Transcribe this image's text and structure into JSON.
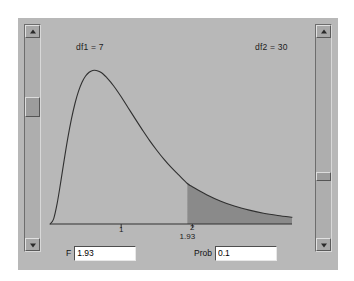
{
  "app": {
    "title": "F Distribution Calculator",
    "panel_bg": "#b8b8b8",
    "curve_color": "#303030",
    "shade_color": "#8a8a8a"
  },
  "plot": {
    "df1_label": "df1 = 7",
    "df2_label": "df2 = 30",
    "tick_labels": [
      "1",
      "2"
    ],
    "critical_annotation": "1.93"
  },
  "scrollbars": {
    "df1": {
      "name": "df1-scrollbar",
      "up_arrow": "triangle-up-icon",
      "down_arrow": "triangle-down-icon",
      "thumb_position_percent": 33
    },
    "df2": {
      "name": "df2-scrollbar",
      "up_arrow": "triangle-up-icon",
      "down_arrow": "triangle-down-icon",
      "thumb_position_percent": 70
    }
  },
  "controls": {
    "f_label": "F",
    "f_value": "1.93",
    "prob_label": "Prob",
    "prob_value": "0.1"
  },
  "chart_data": {
    "type": "line",
    "title": "",
    "xlabel": "",
    "ylabel": "",
    "xlim": [
      0,
      3.4
    ],
    "ylim": [
      0,
      0.85
    ],
    "grid": false,
    "legend": "none",
    "distribution": "F",
    "df1": 7,
    "df2": 30,
    "critical_value": 1.93,
    "tail_probability": 0.1,
    "shaded_region": {
      "from": 1.93,
      "to": 3.4,
      "side": "right-tail"
    },
    "xticks": [
      1,
      2
    ],
    "xticklabels": [
      "1",
      "2"
    ],
    "annotations": [
      {
        "text": "df1 = 7",
        "x": 0.45,
        "y": 0.72
      },
      {
        "text": "df2 = 30",
        "x": 2.55,
        "y": 0.72
      },
      {
        "text": "1.93",
        "x": 1.93,
        "y": -0.08
      }
    ],
    "x": [
      0.0,
      0.05,
      0.1,
      0.15,
      0.2,
      0.25,
      0.3,
      0.35,
      0.4,
      0.45,
      0.5,
      0.55,
      0.6,
      0.65,
      0.7,
      0.75,
      0.8,
      0.85,
      0.9,
      0.95,
      1.0,
      1.1,
      1.2,
      1.3,
      1.4,
      1.5,
      1.6,
      1.7,
      1.8,
      1.93,
      2.0,
      2.2,
      2.4,
      2.6,
      2.8,
      3.0,
      3.2,
      3.4
    ],
    "y": [
      0.0,
      0.022,
      0.091,
      0.186,
      0.288,
      0.384,
      0.468,
      0.538,
      0.593,
      0.634,
      0.662,
      0.679,
      0.687,
      0.687,
      0.681,
      0.67,
      0.654,
      0.636,
      0.615,
      0.593,
      0.569,
      0.519,
      0.469,
      0.42,
      0.373,
      0.33,
      0.29,
      0.254,
      0.222,
      0.181,
      0.167,
      0.131,
      0.102,
      0.079,
      0.062,
      0.048,
      0.038,
      0.03
    ]
  }
}
